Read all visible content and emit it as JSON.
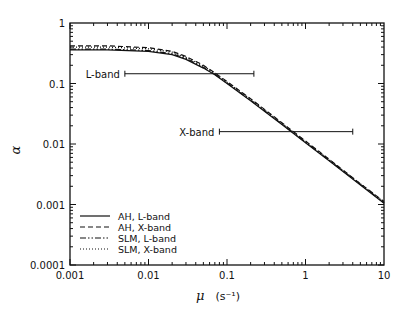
{
  "chart_data": {
    "type": "line",
    "title": "",
    "xlabel": "μ (s⁻¹)",
    "xlabel_symbol": "μ",
    "xlabel_unit": "(s⁻¹)",
    "ylabel": "α",
    "xscale": "log",
    "yscale": "log",
    "xlim": [
      0.001,
      10
    ],
    "ylim": [
      0.0001,
      1
    ],
    "x_ticks": [
      "0.001",
      "0.01",
      "0.1",
      "1",
      "10"
    ],
    "y_ticks": [
      "0.0001",
      "0.001",
      "0.01",
      "0.1",
      "1"
    ],
    "grid": false,
    "legend_position": "lower left",
    "series": [
      {
        "name": "AH, L-band",
        "style": "solid",
        "x": [
          0.001,
          0.003,
          0.01,
          0.02,
          0.03,
          0.05,
          0.07,
          0.1,
          0.2,
          0.5,
          1,
          2,
          5,
          10
        ],
        "values": [
          0.36,
          0.36,
          0.34,
          0.3,
          0.25,
          0.18,
          0.14,
          0.1,
          0.052,
          0.021,
          0.0105,
          0.0053,
          0.0021,
          0.00105
        ]
      },
      {
        "name": "AH, X-band",
        "style": "dashed",
        "x": [
          0.001,
          0.003,
          0.01,
          0.02,
          0.03,
          0.05,
          0.07,
          0.1,
          0.2,
          0.5,
          1,
          2,
          5,
          10
        ],
        "values": [
          0.42,
          0.42,
          0.39,
          0.34,
          0.28,
          0.2,
          0.15,
          0.108,
          0.056,
          0.0225,
          0.0112,
          0.0056,
          0.0022,
          0.00112
        ]
      },
      {
        "name": "SLM, L-band",
        "style": "dashdot",
        "x": [
          0.001,
          0.003,
          0.01,
          0.02,
          0.03,
          0.05,
          0.07,
          0.1,
          0.2,
          0.5,
          1,
          2,
          5,
          10
        ],
        "values": [
          0.37,
          0.37,
          0.35,
          0.31,
          0.26,
          0.185,
          0.142,
          0.102,
          0.053,
          0.0215,
          0.0107,
          0.0054,
          0.00215,
          0.00107
        ]
      },
      {
        "name": "SLM, X-band",
        "style": "dotted",
        "x": [
          0.001,
          0.003,
          0.01,
          0.02,
          0.03,
          0.05,
          0.07,
          0.1,
          0.2,
          0.5,
          1,
          2,
          5,
          10
        ],
        "values": [
          0.4,
          0.4,
          0.375,
          0.33,
          0.27,
          0.195,
          0.148,
          0.105,
          0.055,
          0.022,
          0.011,
          0.0055,
          0.0022,
          0.0011
        ]
      }
    ],
    "annotations": [
      {
        "label": "L-band",
        "y": 0.145,
        "x_range": [
          0.005,
          0.22
        ]
      },
      {
        "label": "X-band",
        "y": 0.016,
        "x_range": [
          0.08,
          4.0
        ]
      }
    ]
  }
}
